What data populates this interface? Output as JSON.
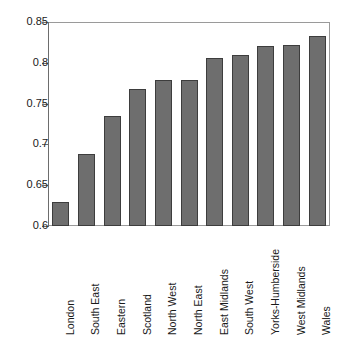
{
  "chart_data": {
    "type": "bar",
    "title": "",
    "subtitle": "",
    "xlabel": "",
    "ylabel": "",
    "categories": [
      "London",
      "South East",
      "Eastern",
      "Scotland",
      "North West",
      "North East",
      "East Midlands",
      "South West",
      "Yorks-Humberside",
      "West Midlands",
      "Wales"
    ],
    "values": [
      0.629,
      0.688,
      0.735,
      0.768,
      0.779,
      0.779,
      0.806,
      0.809,
      0.821,
      0.822,
      0.833
    ],
    "ylim": [
      0.6,
      0.85
    ],
    "yticks": [
      0.6,
      0.65,
      0.7,
      0.75,
      0.8,
      0.85
    ],
    "ytick_labels": [
      "0.6",
      "0.65",
      "0.7",
      "0.75",
      "0.8",
      "0.85"
    ],
    "xtick_label_rotation": 90,
    "grid": false,
    "legend": null,
    "legend_position": "none",
    "series": [
      {
        "name": "",
        "values": [
          0.629,
          0.688,
          0.735,
          0.768,
          0.779,
          0.779,
          0.806,
          0.809,
          0.821,
          0.822,
          0.833
        ]
      }
    ],
    "colors": {
      "bar_fill": "#6e6e6e",
      "bar_border": "#3d3d3d",
      "axis": "#6d6d6d",
      "frame": "#9a9a9a",
      "text": "#1a1a1a",
      "background": "#ffffff"
    }
  }
}
